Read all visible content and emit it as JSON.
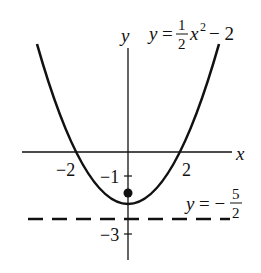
{
  "figure": {
    "type": "function-graph",
    "function_label": {
      "lhs": "y",
      "eq": "=",
      "coef_num": "1",
      "coef_den": "2",
      "var": "x",
      "exp": "2",
      "tail": "− 2"
    },
    "asymptote_label": {
      "lhs": "y",
      "eq": "= −",
      "num": "5",
      "den": "2"
    },
    "axes": {
      "x_label": "x",
      "y_label": "y"
    },
    "x_ticks": [
      {
        "value": -2,
        "label": "−2"
      },
      {
        "value": 2,
        "label": "2"
      }
    ],
    "y_ticks": [
      {
        "value": -1,
        "label": "−1"
      },
      {
        "value": -3,
        "label": "−3"
      }
    ],
    "point": {
      "x": 0,
      "y": -1.5,
      "style": "filled"
    },
    "dashed_line": {
      "y": -2.5
    },
    "colors": {
      "ink": "#111111",
      "background": "#ffffff"
    }
  }
}
